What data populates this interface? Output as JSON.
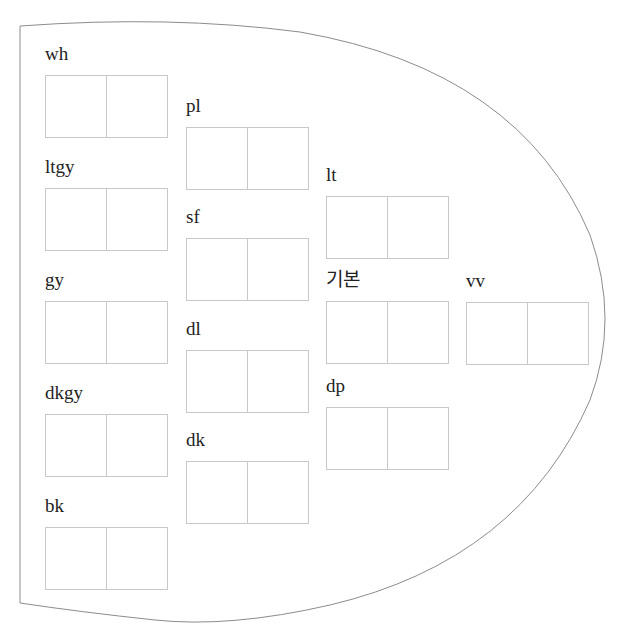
{
  "diagram": {
    "title": "",
    "outline_color": "#8c8c8c",
    "box_border_color": "#c8c8c8",
    "swatches": [
      {
        "label": "wh",
        "x": 45,
        "y": 75
      },
      {
        "label": "ltgy",
        "x": 45,
        "y": 188
      },
      {
        "label": "gy",
        "x": 45,
        "y": 301
      },
      {
        "label": "dkgy",
        "x": 45,
        "y": 414
      },
      {
        "label": "bk",
        "x": 45,
        "y": 527
      },
      {
        "label": "pl",
        "x": 186,
        "y": 127
      },
      {
        "label": "sf",
        "x": 186,
        "y": 238
      },
      {
        "label": "dl",
        "x": 186,
        "y": 350
      },
      {
        "label": "dk",
        "x": 186,
        "y": 461
      },
      {
        "label": "lt",
        "x": 326,
        "y": 196
      },
      {
        "label": "기본",
        "x": 326,
        "y": 301
      },
      {
        "label": "dp",
        "x": 326,
        "y": 407
      },
      {
        "label": "vv",
        "x": 466,
        "y": 302
      }
    ]
  }
}
